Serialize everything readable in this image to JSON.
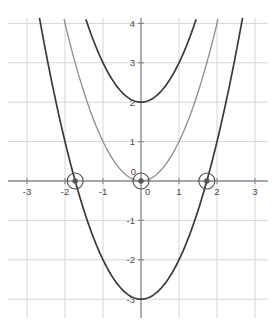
{
  "chart_data": {
    "type": "line",
    "title": "",
    "xlabel": "",
    "ylabel": "",
    "xlim": [
      -3.35,
      3.35
    ],
    "ylim": [
      -3.3,
      4.3
    ],
    "grid": true,
    "legend_position": "none",
    "x_ticks": [
      "-3",
      "-2",
      "-1",
      "0",
      "1",
      "2",
      "3"
    ],
    "x_tick_values": [
      -3,
      -2,
      -1,
      0,
      1,
      2,
      3
    ],
    "y_ticks": [
      "4",
      "3",
      "2",
      "1",
      "0",
      "-1",
      "-2",
      "-3"
    ],
    "y_tick_values": [
      4,
      3,
      2,
      1,
      0,
      -1,
      -2,
      -3
    ],
    "origin_label": "0",
    "series": [
      {
        "name": "y = x^2 + 2",
        "color": "#3a3a3a",
        "vertex": [
          0,
          2
        ],
        "coefficient": 1,
        "constant": 2,
        "x": [
          -1.52,
          -1.2,
          -0.9,
          -0.6,
          -0.3,
          0,
          0.3,
          0.6,
          0.9,
          1.2,
          1.52
        ],
        "values": [
          4.3,
          3.44,
          2.81,
          2.36,
          2.09,
          2,
          2.09,
          2.36,
          2.81,
          3.44,
          4.3
        ]
      },
      {
        "name": "y = x^2",
        "color": "#8c8c8c",
        "vertex": [
          0,
          0
        ],
        "coefficient": 1,
        "constant": 0,
        "x": [
          -2.07,
          -1.6,
          -1.2,
          -0.8,
          -0.4,
          0,
          0.4,
          0.8,
          1.2,
          1.6,
          2.07
        ],
        "values": [
          4.3,
          2.56,
          1.44,
          0.64,
          0.16,
          0,
          0.16,
          0.64,
          1.44,
          2.56,
          4.3
        ]
      },
      {
        "name": "y = x^2 - 3",
        "color": "#3a3a3a",
        "vertex": [
          0,
          -3
        ],
        "coefficient": 1,
        "constant": -3,
        "x": [
          -2.7,
          -2.2,
          -1.73,
          -1.2,
          -0.6,
          0,
          0.6,
          1.2,
          1.73,
          2.2,
          2.7
        ],
        "values": [
          4.3,
          1.84,
          0,
          -1.56,
          -2.64,
          -3,
          -2.64,
          -1.56,
          0,
          1.84,
          4.3
        ]
      }
    ],
    "marked_points": [
      {
        "name": "left-root",
        "x": -1.732,
        "y": 0,
        "circled": true
      },
      {
        "name": "origin-point",
        "x": 0,
        "y": 0,
        "circled": true
      },
      {
        "name": "right-root",
        "x": 1.732,
        "y": 0,
        "circled": true
      }
    ],
    "colors": {
      "background": "#ffffff",
      "grid": "#d6d6d6",
      "axis": "#8a8a8a",
      "curve_dark": "#3a3a3a",
      "curve_light": "#8c8c8c",
      "marker": "#555555"
    }
  }
}
